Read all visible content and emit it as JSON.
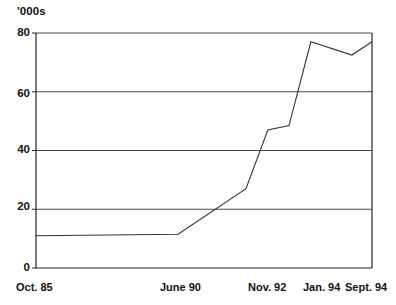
{
  "chart_data": {
    "type": "line",
    "title": "",
    "subtitle": "",
    "ylabel": "'000s",
    "xlabel": "",
    "ylim": [
      0,
      80
    ],
    "yticks": [
      0,
      20,
      40,
      60,
      80
    ],
    "ytick_labels": [
      "0",
      "20",
      "40",
      "60",
      "80"
    ],
    "grid": "horizontal",
    "legend": "none",
    "categories": [
      "Oct. 85",
      "June 90",
      "Nov. 92",
      "Jan. 94",
      "Sept. 94"
    ],
    "xtick_labels": [
      "Oct. 85",
      "June 90",
      "Nov. 92",
      "Jan. 94",
      "Sept. 94"
    ],
    "series": [
      {
        "name": "",
        "color": "#333333",
        "points": [
          {
            "x_label": "Oct. 85",
            "x": 0,
            "y": 11
          },
          {
            "x_label": "June 90",
            "x": 42.3,
            "y": 11.5
          },
          {
            "x_label": "",
            "x": 62.5,
            "y": 27
          },
          {
            "x_label": "Nov. 92",
            "x": 69.0,
            "y": 47
          },
          {
            "x_label": "",
            "x": 75.3,
            "y": 48.5
          },
          {
            "x_label": "Jan. 94",
            "x": 81.8,
            "y": 77
          },
          {
            "x_label": "",
            "x": 94.0,
            "y": 72.5
          },
          {
            "x_label": "Sept. 94",
            "x": 100,
            "y": 77
          }
        ]
      }
    ]
  },
  "axes": {
    "unit_label": "'000s",
    "y_labels": [
      "80",
      "60",
      "40",
      "20",
      "0"
    ],
    "x_labels": [
      "Oct. 85",
      "June 90",
      "Nov. 92",
      "Jan. 94",
      "Sept. 94"
    ]
  },
  "colors": {
    "line": "#333333",
    "grid": "#4a4a4a",
    "axis": "#222222",
    "background": "#ffffff",
    "text": "#121212"
  }
}
